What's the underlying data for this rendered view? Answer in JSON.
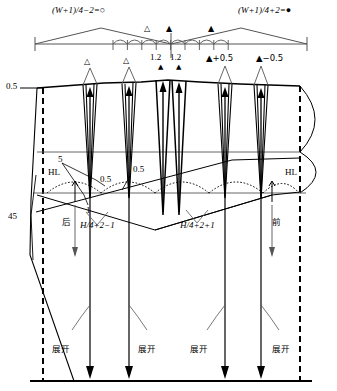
{
  "diagram": {
    "title_top_left": "(W+1)/4−2=○",
    "title_top_right": "(W+1)/4+2=●",
    "ruler": {
      "markers": [
        "△",
        "▲",
        "▲"
      ],
      "center_tick": true
    },
    "dart_labels": [
      {
        "id": "dart-1",
        "text": "△"
      },
      {
        "id": "dart-2",
        "text": "△"
      },
      {
        "id": "dart-3",
        "text": "1.2"
      },
      {
        "id": "dart-4",
        "text": "1.2"
      },
      {
        "id": "dart-5",
        "text": "▲+0.5"
      },
      {
        "id": "dart-6",
        "text": "▲−0.5"
      }
    ],
    "dart_marker_3": "▲",
    "dart_marker_4": "▲",
    "left_top_value": "0.5",
    "left_side_value": "45",
    "hl_left": "HL",
    "hl_right": "HL",
    "note_5": "5",
    "note_1": "1",
    "note_05_a": "0.5",
    "note_05_b": "0.5",
    "back_label": "后",
    "front_label": "前",
    "formula_back": "H/4+2−1",
    "formula_front": "H/4+2+1",
    "expand_labels": [
      "展开",
      "展开",
      "展开",
      "展开"
    ],
    "colors": {
      "line": "#000000",
      "thin": "#555555",
      "background": "#ffffff"
    }
  }
}
